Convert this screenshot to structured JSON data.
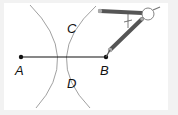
{
  "diagram": {
    "points": [
      {
        "label": "A",
        "x": 21,
        "y": 57
      },
      {
        "label": "B",
        "x": 106,
        "y": 57
      },
      {
        "label": "C",
        "x": 64,
        "y": 30
      },
      {
        "label": "D",
        "x": 64,
        "y": 84
      }
    ],
    "labels": {
      "A": "A",
      "B": "B",
      "C": "C",
      "D": "D"
    },
    "colors": {
      "segment": "#111111",
      "arc": "#777777",
      "compass_arm": "#555555",
      "compass_tip": "#999999",
      "frame": "#f2f2f2"
    }
  }
}
